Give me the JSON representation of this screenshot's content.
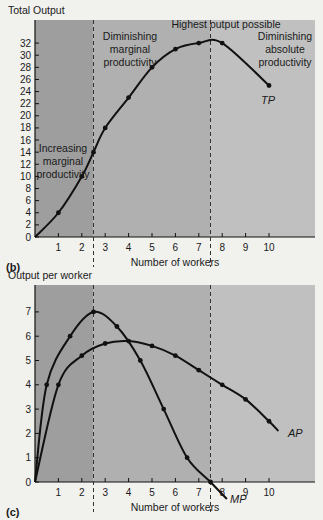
{
  "colors": {
    "background": "#f1f1ee",
    "region_dark": "#9e9e9e",
    "region_mid": "#b0b0b0",
    "region_light": "#c0c0c0",
    "curve": "#111111"
  },
  "panels": {
    "b": {
      "label": "(b)",
      "ylabel": "Total Output",
      "xlabel": "Number of workers",
      "region_labels": {
        "increasing": [
          "Increasing",
          "marginal",
          "productivity"
        ],
        "diminishing_marginal": [
          "Diminishing",
          "marginal",
          "productivity"
        ],
        "highest": "Highest output possible",
        "diminishing_absolute": [
          "Diminishing",
          "absolute",
          "productivity"
        ]
      },
      "curve_label": "TP"
    },
    "c": {
      "label": "(c)",
      "ylabel": "Output per worker",
      "xlabel": "Number of workers",
      "curve_labels": {
        "ap": "AP",
        "mp": "MP"
      }
    }
  },
  "chart_data": [
    {
      "type": "line",
      "title": "",
      "panel": "(b)",
      "xlabel": "Number of workers",
      "ylabel": "Total Output",
      "x_ticks": [
        1,
        2,
        3,
        4,
        5,
        6,
        7,
        8,
        9,
        10
      ],
      "y_ticks": [
        0,
        2,
        4,
        6,
        8,
        10,
        12,
        14,
        16,
        18,
        20,
        22,
        24,
        26,
        28,
        30,
        32
      ],
      "xlim": [
        0,
        11.5
      ],
      "ylim": [
        0,
        34
      ],
      "grid": false,
      "series": [
        {
          "name": "TP",
          "x": [
            0,
            1,
            2,
            2.5,
            3,
            4,
            5,
            6,
            7,
            8,
            10
          ],
          "y": [
            0,
            4,
            10,
            14,
            18,
            23,
            28,
            31,
            32,
            32,
            25
          ]
        }
      ],
      "vertical_dashed_lines": [
        2.5,
        7.5
      ],
      "annotations": [
        "Increasing marginal productivity",
        "Diminishing marginal productivity",
        "Highest output possible",
        "Diminishing absolute productivity"
      ]
    },
    {
      "type": "line",
      "title": "",
      "panel": "(c)",
      "xlabel": "Number of workers",
      "ylabel": "Output per worker",
      "x_ticks": [
        1,
        2,
        3,
        4,
        5,
        6,
        7,
        8,
        9,
        10
      ],
      "y_ticks": [
        0,
        1,
        2,
        3,
        4,
        5,
        6,
        7
      ],
      "xlim": [
        0,
        11.5
      ],
      "ylim": [
        0,
        7.8
      ],
      "grid": false,
      "series": [
        {
          "name": "MP",
          "x": [
            0,
            0.5,
            1.5,
            2.5,
            3.5,
            4.5,
            5.5,
            6.5,
            7.5,
            8.2
          ],
          "y": [
            0,
            4,
            6,
            7,
            6.4,
            5,
            3,
            1,
            0,
            -0.7
          ]
        },
        {
          "name": "AP",
          "x": [
            0,
            1,
            2,
            3,
            4,
            5,
            6,
            7,
            8,
            9,
            10,
            10.4
          ],
          "y": [
            0,
            4,
            5.2,
            5.7,
            5.8,
            5.6,
            5.2,
            4.6,
            4.0,
            3.4,
            2.5,
            2.1
          ]
        }
      ],
      "vertical_dashed_lines": [
        2.5,
        7.5
      ]
    }
  ]
}
